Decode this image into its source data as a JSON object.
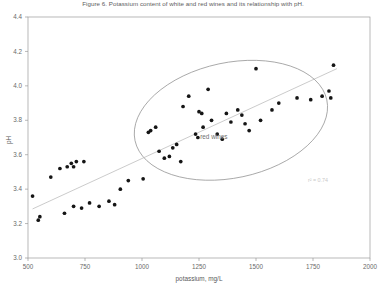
{
  "figure": {
    "title": "Figure 6.  Potassium content of white and red wines and its relationship with  pH."
  },
  "chart_data": {
    "type": "scatter",
    "title": "Figure 6.  Potassium content of white and red wines and its relationship with  pH.",
    "xlabel": "potassium, mg/L",
    "ylabel": "pH",
    "xlim": [
      500,
      2000
    ],
    "ylim": [
      3.0,
      4.4
    ],
    "xticks": [
      500,
      750,
      1000,
      1250,
      1500,
      1750,
      2000
    ],
    "xtick_labels": [
      "500",
      "750",
      "1000",
      "1250",
      "1500",
      "1750",
      "2000"
    ],
    "yticks": [
      3.0,
      3.2,
      3.4,
      3.6,
      3.8,
      4.0,
      4.2,
      4.4
    ],
    "ytick_labels": [
      "3.0",
      "3.2",
      "3.4",
      "3.6",
      "3.8",
      "4.0",
      "4.2",
      "4.4"
    ],
    "grid": false,
    "legend": false,
    "points": [
      [
        520,
        3.36
      ],
      [
        545,
        3.22
      ],
      [
        552,
        3.24
      ],
      [
        600,
        3.47
      ],
      [
        640,
        3.52
      ],
      [
        672,
        3.53
      ],
      [
        690,
        3.55
      ],
      [
        700,
        3.53
      ],
      [
        712,
        3.56
      ],
      [
        745,
        3.56
      ],
      [
        660,
        3.26
      ],
      [
        700,
        3.3
      ],
      [
        735,
        3.29
      ],
      [
        770,
        3.32
      ],
      [
        812,
        3.3
      ],
      [
        855,
        3.33
      ],
      [
        880,
        3.31
      ],
      [
        905,
        3.4
      ],
      [
        940,
        3.45
      ],
      [
        1005,
        3.46
      ],
      [
        1028,
        3.73
      ],
      [
        1038,
        3.74
      ],
      [
        1060,
        3.76
      ],
      [
        1075,
        3.62
      ],
      [
        1098,
        3.58
      ],
      [
        1120,
        3.59
      ],
      [
        1135,
        3.64
      ],
      [
        1152,
        3.66
      ],
      [
        1170,
        3.56
      ],
      [
        1180,
        3.88
      ],
      [
        1205,
        3.94
      ],
      [
        1235,
        3.72
      ],
      [
        1245,
        3.7
      ],
      [
        1250,
        3.85
      ],
      [
        1262,
        3.84
      ],
      [
        1268,
        3.76
      ],
      [
        1290,
        3.98
      ],
      [
        1305,
        3.8
      ],
      [
        1330,
        3.72
      ],
      [
        1352,
        3.69
      ],
      [
        1370,
        3.84
      ],
      [
        1390,
        3.79
      ],
      [
        1420,
        3.86
      ],
      [
        1438,
        3.83
      ],
      [
        1452,
        3.78
      ],
      [
        1470,
        3.74
      ],
      [
        1500,
        4.1
      ],
      [
        1520,
        3.8
      ],
      [
        1570,
        3.86
      ],
      [
        1600,
        3.9
      ],
      [
        1680,
        3.93
      ],
      [
        1740,
        3.92
      ],
      [
        1790,
        3.94
      ],
      [
        1820,
        3.97
      ],
      [
        1828,
        3.93
      ],
      [
        1840,
        4.12
      ]
    ],
    "trend_line": {
      "x": [
        520,
        1855
      ],
      "y": [
        3.285,
        4.1
      ]
    },
    "annotations": [
      {
        "name": "red-wines-group",
        "text": "red wines",
        "x": 1315,
        "y": 3.69
      },
      {
        "name": "r-squared",
        "text": "r² = 0.74",
        "x": 1772,
        "y": 3.44
      }
    ],
    "ellipse": {
      "label": "red wines",
      "cx_value": 1390,
      "cy_value": 3.8,
      "rx_value": 430,
      "ry_value": 0.335,
      "rotation_deg": -12
    }
  }
}
